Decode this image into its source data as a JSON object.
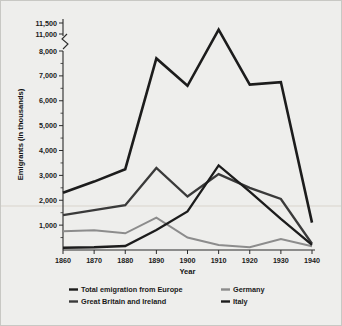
{
  "figure": {
    "background_color": "#eeeeec",
    "border_color": "#c8c8c4"
  },
  "axes": {
    "xlabel": "Year",
    "ylabel": "Emigrants (in thousands)",
    "x_ticks": [
      "1860",
      "1870",
      "1880",
      "1890",
      "1900",
      "1910",
      "1920",
      "1930",
      "1940"
    ],
    "y_ticks": [
      "1,000",
      "2,000",
      "3,000",
      "4,000",
      "5,000",
      "6,000",
      "7,000",
      "8,000",
      "11,000",
      "11,500"
    ],
    "axis_break_between": [
      "8,000",
      "11,000"
    ],
    "axis_color": "#2b2b2b"
  },
  "legend": {
    "entries": [
      {
        "label": "Total emigration from Europe",
        "color": "#1c1c1c",
        "column": 0
      },
      {
        "label": "Great Britain and Ireland",
        "color": "#3a3a3a",
        "column": 0
      },
      {
        "label": "Germany",
        "color": "#8c8c8c",
        "column": 1
      },
      {
        "label": "Italy",
        "color": "#1c1c1c",
        "column": 1
      }
    ]
  },
  "chart_data": {
    "type": "line",
    "title": "",
    "xlabel": "Year",
    "ylabel": "Emigrants (in thousands)",
    "x": [
      1860,
      1870,
      1880,
      1890,
      1900,
      1910,
      1920,
      1930,
      1940
    ],
    "xlim": [
      1860,
      1940
    ],
    "ylim": [
      0,
      11500
    ],
    "y_axis_break": [
      8000,
      11000
    ],
    "grid": false,
    "legend_position": "below",
    "series": [
      {
        "name": "Total emigration from Europe",
        "color": "#1c1c1c",
        "width": 2.6,
        "values": [
          2300,
          2750,
          3250,
          7700,
          6600,
          11200,
          8700,
          6750,
          1100
        ]
      },
      {
        "name": "Great Britain and Ireland",
        "color": "#3a3a3a",
        "width": 2.3,
        "values": [
          1400,
          1600,
          1800,
          3300,
          2150,
          3050,
          2500,
          2050,
          250
        ]
      },
      {
        "name": "Germany",
        "color": "#8c8c8c",
        "width": 2.0,
        "values": [
          750,
          790,
          670,
          1300,
          500,
          200,
          110,
          440,
          150
        ]
      },
      {
        "name": "Italy",
        "color": "#1c1c1c",
        "width": 2.3,
        "values": [
          90,
          110,
          160,
          800,
          1550,
          3400,
          2350,
          1250,
          210
        ]
      }
    ]
  }
}
